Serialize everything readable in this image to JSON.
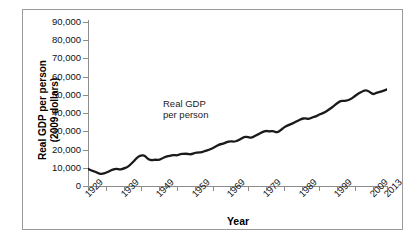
{
  "chart_data": {
    "type": "line",
    "title": "",
    "xlabel": "Year",
    "ylabel": "Real GDP per person (2009 dollars)",
    "ylabel_line1": "Real GDP per person",
    "ylabel_line2": "(2009 dollars)",
    "annotation_line1": "Real GDP",
    "annotation_line2": "per person",
    "series_name": "Real GDP per person",
    "line_color": "#1a1a1a",
    "axis_color": "#8c8c8c",
    "grid": false,
    "legend": "none",
    "xlim": [
      1929,
      2013
    ],
    "ylim": [
      0,
      90000
    ],
    "ytick_values": [
      0,
      10000,
      20000,
      30000,
      40000,
      50000,
      60000,
      70000,
      80000,
      90000
    ],
    "ytick_labels": [
      "0",
      "10,000",
      "20,000",
      "30,000",
      "40,000",
      "50,000",
      "60,000",
      "70,000",
      "80,000",
      "90,000"
    ],
    "xtick_values": [
      1929,
      1934,
      1939,
      1944,
      1949,
      1954,
      1959,
      1964,
      1969,
      1974,
      1979,
      1984,
      1989,
      1994,
      1999,
      2004,
      2009,
      2013
    ],
    "xtick_labeled": [
      1929,
      1939,
      1949,
      1959,
      1969,
      1979,
      1989,
      1999,
      2009,
      2013
    ],
    "xtick_labels": [
      "1929",
      "1939",
      "1949",
      "1959",
      "1969",
      "1979",
      "1989",
      "1999",
      "2009",
      "2013"
    ],
    "x": [
      1929,
      1930,
      1931,
      1932,
      1933,
      1934,
      1935,
      1936,
      1937,
      1938,
      1939,
      1940,
      1941,
      1942,
      1943,
      1944,
      1945,
      1946,
      1947,
      1948,
      1949,
      1950,
      1951,
      1952,
      1953,
      1954,
      1955,
      1956,
      1957,
      1958,
      1959,
      1960,
      1961,
      1962,
      1963,
      1964,
      1965,
      1966,
      1967,
      1968,
      1969,
      1970,
      1971,
      1972,
      1973,
      1974,
      1975,
      1976,
      1977,
      1978,
      1979,
      1980,
      1981,
      1982,
      1983,
      1984,
      1985,
      1986,
      1987,
      1988,
      1989,
      1990,
      1991,
      1992,
      1993,
      1994,
      1995,
      1996,
      1997,
      1998,
      1999,
      2000,
      2001,
      2002,
      2003,
      2004,
      2005,
      2006,
      2007,
      2008,
      2009,
      2010,
      2011,
      2012,
      2013
    ],
    "values": [
      9400,
      8500,
      7900,
      6800,
      6600,
      7200,
      8100,
      9100,
      9500,
      9000,
      9600,
      10300,
      11900,
      13900,
      16000,
      17000,
      16600,
      14500,
      14100,
      14500,
      14200,
      15300,
      16200,
      16600,
      17100,
      16700,
      17600,
      17700,
      17700,
      17300,
      18200,
      18400,
      18500,
      19300,
      19900,
      20800,
      21800,
      22900,
      23200,
      24100,
      24600,
      24300,
      24800,
      25900,
      27100,
      26700,
      26400,
      27600,
      28500,
      29700,
      30300,
      29900,
      30300,
      29300,
      30300,
      32100,
      33100,
      34000,
      34800,
      35900,
      36900,
      37200,
      36700,
      37600,
      38200,
      39300,
      39900,
      41000,
      42400,
      43800,
      45400,
      46800,
      46700,
      47000,
      47900,
      49400,
      50700,
      51800,
      52700,
      51900,
      50200,
      51100,
      51600,
      52300,
      53000
    ]
  }
}
